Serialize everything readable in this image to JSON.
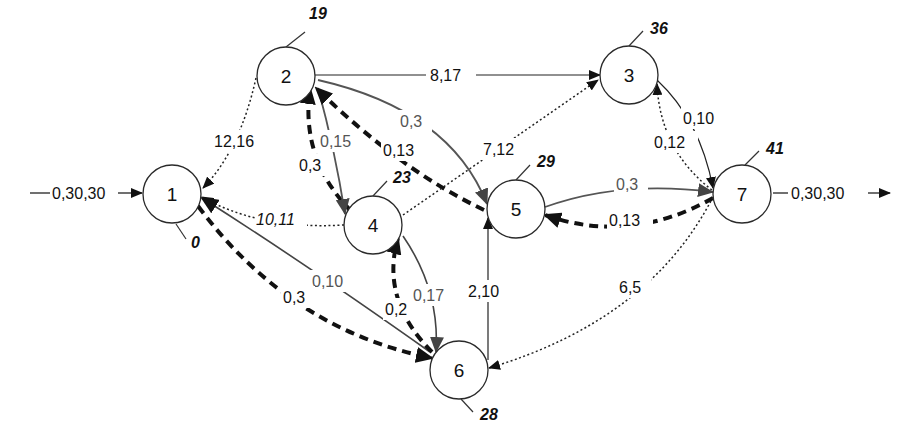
{
  "diagram": {
    "type": "network-flow-graph",
    "colors": {
      "solid_black": "#222222",
      "solid_gray": "#555555",
      "dashed_bold": "#111111",
      "dotted": "#222222",
      "gray_arrowhead": "#444444"
    },
    "nodes": [
      {
        "id": "1",
        "label": "1",
        "potential": "0"
      },
      {
        "id": "2",
        "label": "2",
        "potential": "19"
      },
      {
        "id": "3",
        "label": "3",
        "potential": "36"
      },
      {
        "id": "4",
        "label": "4",
        "potential": "23"
      },
      {
        "id": "5",
        "label": "5",
        "potential": "29"
      },
      {
        "id": "6",
        "label": "6",
        "potential": "28"
      },
      {
        "id": "7",
        "label": "7",
        "potential": "41"
      }
    ],
    "source_arrow": {
      "label": "0,30,30",
      "to": "1"
    },
    "sink_arrow": {
      "label": "0,30,30",
      "from": "7"
    },
    "edges": [
      {
        "from": "2",
        "to": "3",
        "label": "8,17",
        "style": "solid"
      },
      {
        "from": "2",
        "to": "1",
        "label": "12,16",
        "style": "dotted"
      },
      {
        "from": "4",
        "to": "1",
        "label": "10,11",
        "style": "dotted-italic"
      },
      {
        "from": "4",
        "to": "2",
        "label": "0,3",
        "style": "dashed-bold"
      },
      {
        "from": "2",
        "to": "4",
        "label": "0,15",
        "style": "solid-gray"
      },
      {
        "from": "2",
        "to": "5",
        "label": "0,3",
        "style": "solid-gray"
      },
      {
        "from": "5",
        "to": "2",
        "label": "0,13",
        "style": "dashed-bold"
      },
      {
        "from": "5",
        "to": "3",
        "label": "7,12",
        "style": "dotted"
      },
      {
        "from": "6",
        "to": "1",
        "label": "0,10",
        "style": "solid-gray"
      },
      {
        "from": "1",
        "to": "6",
        "label": "0,3",
        "style": "dashed-bold"
      },
      {
        "from": "6",
        "to": "4",
        "label": "0,2",
        "style": "dashed-bold"
      },
      {
        "from": "4",
        "to": "6",
        "label": "0,17",
        "style": "solid-gray"
      },
      {
        "from": "6",
        "to": "5",
        "label": "2,10",
        "style": "solid"
      },
      {
        "from": "5",
        "to": "7",
        "label": "0,3",
        "style": "solid-gray"
      },
      {
        "from": "7",
        "to": "5",
        "label": "0,13",
        "style": "dashed-bold"
      },
      {
        "from": "3",
        "to": "7",
        "label": "0,10",
        "style": "solid"
      },
      {
        "from": "7",
        "to": "3",
        "label": "0,12",
        "style": "dotted"
      },
      {
        "from": "7",
        "to": "6",
        "label": "6,5",
        "style": "dotted"
      }
    ]
  }
}
